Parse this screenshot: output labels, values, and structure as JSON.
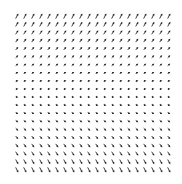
{
  "chart_data": {
    "type": "quiver",
    "title": "",
    "xlabel": "",
    "ylabel": "",
    "axes_visible": false,
    "grid": false,
    "field": {
      "u": "1",
      "v": "y"
    },
    "x": [
      -2.0,
      -1.789,
      -1.579,
      -1.368,
      -1.158,
      -0.947,
      -0.737,
      -0.526,
      -0.316,
      -0.105,
      0.105,
      0.316,
      0.526,
      0.737,
      0.947,
      1.158,
      1.368,
      1.579,
      1.789,
      2.0
    ],
    "y": [
      2.0,
      1.789,
      1.579,
      1.368,
      1.158,
      0.947,
      0.737,
      0.526,
      0.316,
      0.105,
      -0.105,
      -0.316,
      -0.526,
      -0.737,
      -0.947,
      -1.158,
      -1.368,
      -1.579,
      -1.789,
      -2.0
    ],
    "xlim": [
      -2,
      2
    ],
    "ylim": [
      -2,
      2
    ],
    "arrow_color": "#222222"
  }
}
